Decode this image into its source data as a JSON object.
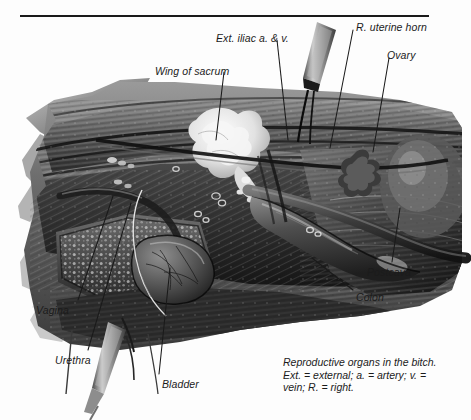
{
  "figure": {
    "title_rule": "horizontal-rule",
    "subject": "Reproductive organs in the bitch",
    "media": "grayscale surgical anatomical illustration",
    "background_color": "#ffffff",
    "ink_color": "#1a1a1a"
  },
  "labels": [
    {
      "id": "ext-iliac",
      "text": "Ext. iliac a. & v.",
      "x": 216,
      "y": 33,
      "anchor": "start"
    },
    {
      "id": "r-uterine-horn",
      "text": "R. uterine horn",
      "x": 356,
      "y": 22,
      "anchor": "start"
    },
    {
      "id": "wing-of-sacrum",
      "text": "Wing of sacrum",
      "x": 155,
      "y": 66,
      "anchor": "start"
    },
    {
      "id": "ovary",
      "text": "Ovary",
      "x": 387,
      "y": 50,
      "anchor": "start"
    },
    {
      "id": "postcava",
      "text": "Postcava",
      "x": 367,
      "y": 267,
      "anchor": "start"
    },
    {
      "id": "colon",
      "text": "Colon",
      "x": 356,
      "y": 292,
      "anchor": "start"
    },
    {
      "id": "vagina",
      "text": "Vagina",
      "x": 36,
      "y": 305,
      "anchor": "start"
    },
    {
      "id": "urethra",
      "text": "Urethra",
      "x": 55,
      "y": 355,
      "anchor": "start"
    },
    {
      "id": "bladder",
      "text": "Bladder",
      "x": 162,
      "y": 379,
      "anchor": "start"
    }
  ],
  "leader_lines": [
    {
      "for": "ext-iliac",
      "x1": 277,
      "y1": 40,
      "x2": 288,
      "y2": 140
    },
    {
      "for": "r-uterine-horn",
      "x1": 353,
      "y1": 30,
      "x2": 330,
      "y2": 148
    },
    {
      "for": "wing-of-sacrum",
      "x1": 224,
      "y1": 72,
      "x2": 216,
      "y2": 140
    },
    {
      "for": "ovary",
      "x1": 389,
      "y1": 58,
      "x2": 373,
      "y2": 152
    },
    {
      "for": "postcava",
      "x1": 392,
      "y1": 262,
      "x2": 400,
      "y2": 208
    },
    {
      "for": "colon",
      "x1": 353,
      "y1": 290,
      "x2": 312,
      "y2": 258
    },
    {
      "for": "vagina",
      "x1": 78,
      "y1": 300,
      "x2": 113,
      "y2": 196
    },
    {
      "for": "urethra",
      "x1": 88,
      "y1": 350,
      "x2": 131,
      "y2": 203
    },
    {
      "for": "bladder",
      "x1": 159,
      "y1": 374,
      "x2": 170,
      "y2": 268
    }
  ],
  "caption": {
    "lines": [
      "Reproductive organs in the bitch.",
      "Ext. = external; a. = artery; v. =",
      "vein; R. = right."
    ]
  }
}
